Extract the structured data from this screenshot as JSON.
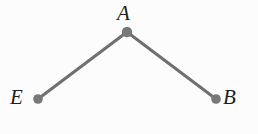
{
  "figure": {
    "kind": "geometry-angle-diagram",
    "background_color": "#fcfcfc",
    "stroke_color": "#6f6f6f",
    "node_fill_color": "#787878",
    "label_color": "#1d1d1d",
    "canvas": {
      "width": 258,
      "height": 134
    },
    "style": {
      "segment_width": 3,
      "node_radius": 4.8
    },
    "vertices": [
      {
        "id": "A",
        "label": "A",
        "x": 127,
        "y": 32,
        "label_x": 127,
        "label_y": 14,
        "label_position": "above"
      },
      {
        "id": "E",
        "label": "E",
        "x": 38,
        "y": 99,
        "label_x": 20,
        "label_y": 99,
        "label_position": "left"
      },
      {
        "id": "B",
        "label": "B",
        "x": 216,
        "y": 99,
        "label_x": 233,
        "label_y": 99,
        "label_position": "right"
      }
    ],
    "segments": [
      {
        "id": "segment-EA",
        "from": "E",
        "to": "A"
      },
      {
        "id": "segment-AB",
        "from": "A",
        "to": "B"
      }
    ]
  }
}
